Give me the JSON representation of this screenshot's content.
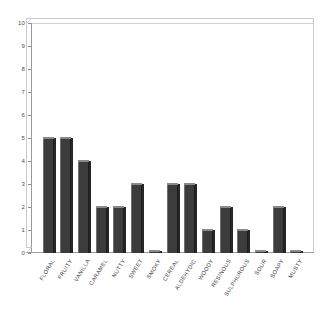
{
  "chart_data": {
    "type": "bar",
    "title": "",
    "subtitle": "",
    "xlabel": "",
    "ylabel": "",
    "ylim": [
      0,
      10
    ],
    "yticks": [
      0,
      1,
      2,
      3,
      4,
      5,
      6,
      7,
      8,
      9,
      10
    ],
    "ytick_labels": [
      "0",
      "1",
      "2",
      "3",
      "4",
      "5",
      "6",
      "7",
      "8",
      "9",
      "10"
    ],
    "grid": false,
    "legend": null,
    "legend_position": "none",
    "bar_color": "#3c3c3c",
    "frame_color": "#cfcfcf",
    "categories": [
      "FLORAL",
      "FRUITY",
      "VANILLA",
      "CARAMEL",
      "NUTTY",
      "SWEET",
      "SMOKY",
      "CEREAL",
      "ALDEHYDIC",
      "WOODY",
      "RESINOUS",
      "SULPHUROUS",
      "SOUR",
      "SOAPY",
      "MUSTY"
    ],
    "values": [
      5,
      5,
      4,
      2,
      2,
      3,
      0,
      3,
      3,
      1,
      2,
      1,
      0,
      2,
      0
    ],
    "series": [
      {
        "name": "",
        "values": [
          5,
          5,
          4,
          2,
          2,
          3,
          0,
          3,
          3,
          1,
          2,
          1,
          0,
          2,
          0
        ]
      }
    ],
    "annotations": []
  }
}
